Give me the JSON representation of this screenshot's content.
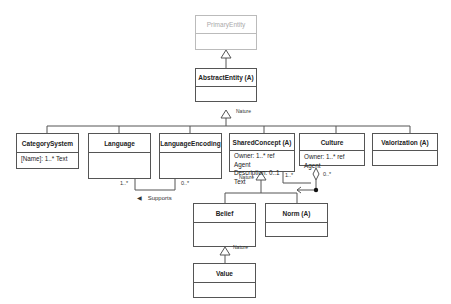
{
  "diagram": {
    "type": "UML class diagram",
    "classes": {
      "primary_entity": {
        "name": "PrimaryEntity",
        "attributes": []
      },
      "abstract_entity": {
        "name": "AbstractEntity (A)",
        "attributes": []
      },
      "category_system": {
        "name": "CategorySystem",
        "attributes": [
          "[Name]: 1..* Text"
        ]
      },
      "language": {
        "name": "Language",
        "attributes": []
      },
      "language_encoding": {
        "name": "LanguageEncoding",
        "attributes": []
      },
      "shared_concept": {
        "name": "SharedConcept (A)",
        "attributes": [
          "Owner: 1..* ref Agent",
          "Description: 0..1 Text"
        ]
      },
      "culture": {
        "name": "Culture",
        "attributes": [
          "Owner: 1..* ref Agent"
        ]
      },
      "valorization": {
        "name": "Valorization (A)",
        "attributes": []
      },
      "belief": {
        "name": "Belief",
        "attributes": []
      },
      "norm": {
        "name": "Norm (A)",
        "attributes": []
      },
      "value": {
        "name": "Value",
        "attributes": []
      }
    },
    "labels": {
      "nature_1": "Nature",
      "nature_2": "Nature",
      "nature_3": "Nature",
      "supports": "Supports",
      "supports_arrow": "◀",
      "mult_language": "1..*",
      "mult_language_encoding": "0..*",
      "mult_shared_concept": "1..*",
      "mult_culture": "0..*"
    },
    "relationships": [
      {
        "type": "generalization",
        "from": "AbstractEntity (A)",
        "to": "PrimaryEntity"
      },
      {
        "type": "generalization",
        "from": [
          "CategorySystem",
          "Language",
          "LanguageEncoding",
          "SharedConcept (A)",
          "Culture",
          "Valorization (A)"
        ],
        "to": "AbstractEntity (A)",
        "label": "Nature"
      },
      {
        "type": "generalization",
        "from": [
          "Belief",
          "Norm (A)"
        ],
        "to": "SharedConcept (A)",
        "label": "Nature"
      },
      {
        "type": "generalization",
        "from": "Value",
        "to": "Belief",
        "label": "Nature"
      },
      {
        "type": "association",
        "ends": [
          "Language",
          "LanguageEncoding"
        ],
        "name": "Supports",
        "multiplicities": [
          "1..*",
          "0..*"
        ]
      },
      {
        "type": "aggregation",
        "whole": "Culture",
        "part": "SharedConcept (A)",
        "multiplicities": [
          "1..*",
          "0..*"
        ]
      }
    ]
  }
}
